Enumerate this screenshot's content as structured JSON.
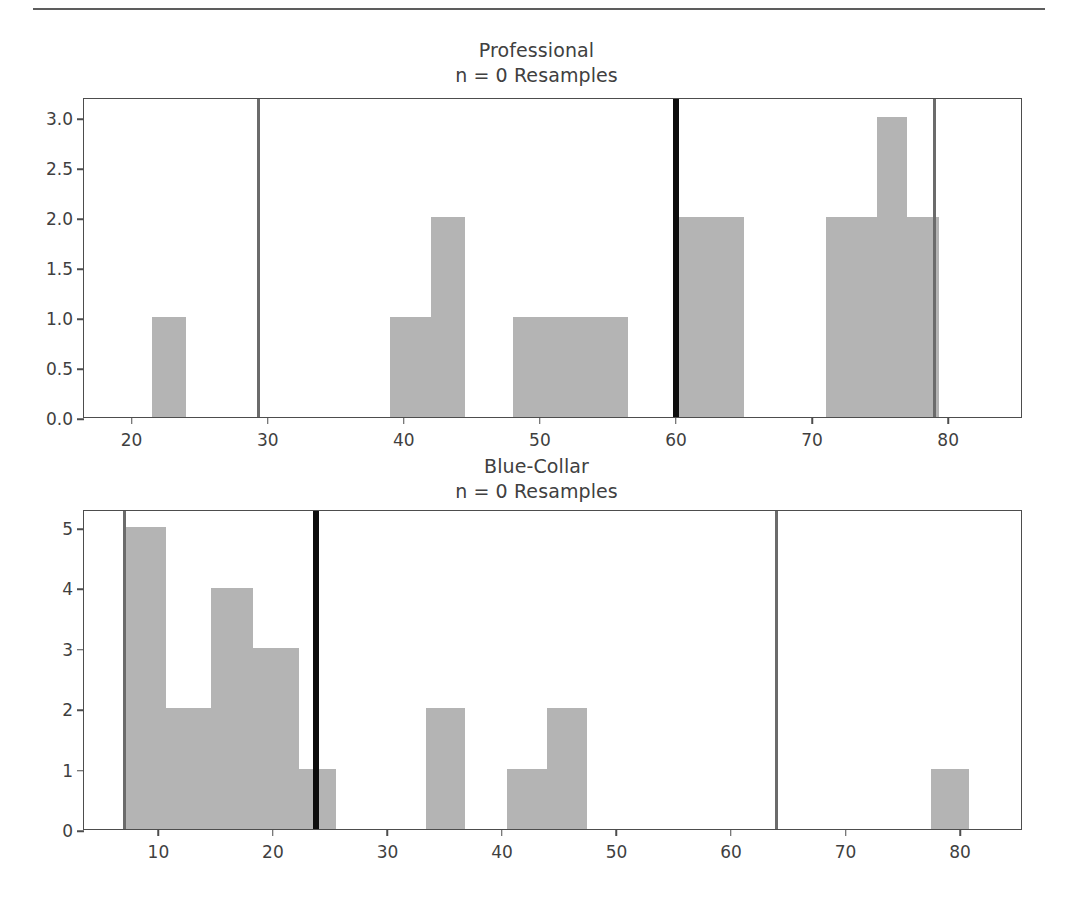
{
  "page": {
    "background": "#ffffff",
    "rule_color": "#5d5d5d"
  },
  "colors": {
    "bar_fill": "#b4b4b4",
    "axis": "#4d4d4d",
    "grey_line": "#6b6b6b",
    "black_line": "#0d0d0d",
    "text": "#3f3f3f"
  },
  "chart_data": [
    {
      "id": "professional",
      "type": "bar",
      "title": "Professional",
      "subtitle": "n = 0 Resamples",
      "xlabel": "",
      "ylabel": "",
      "xlim": [
        16.5,
        85.5
      ],
      "ylim": [
        0.0,
        3.2
      ],
      "grid": false,
      "legend": "none",
      "xticks": [
        20,
        30,
        40,
        50,
        60,
        70,
        80
      ],
      "xtick_labels": [
        "20",
        "30",
        "40",
        "50",
        "60",
        "70",
        "80"
      ],
      "yticks": [
        0.0,
        0.5,
        1.0,
        1.5,
        2.0,
        2.5,
        3.0
      ],
      "ytick_labels": [
        "0.0",
        "0.5",
        "1.0",
        "1.5",
        "2.0",
        "2.5",
        "3.0"
      ],
      "bins": [
        {
          "left": 21.5,
          "right": 24.0,
          "count": 1
        },
        {
          "left": 39.0,
          "right": 42.0,
          "count": 1
        },
        {
          "left": 42.0,
          "right": 44.5,
          "count": 2
        },
        {
          "left": 48.0,
          "right": 56.5,
          "count": 1
        },
        {
          "left": 60.0,
          "right": 65.0,
          "count": 2
        },
        {
          "left": 71.0,
          "right": 74.8,
          "count": 2
        },
        {
          "left": 74.8,
          "right": 77.0,
          "count": 3
        },
        {
          "left": 77.0,
          "right": 79.3,
          "count": 2
        }
      ],
      "vlines": [
        {
          "x": 29.3,
          "color": "#6b6b6b",
          "width": 3,
          "role": "ci-lower"
        },
        {
          "x": 60.0,
          "color": "#0d0d0d",
          "width": 6,
          "role": "observed-statistic"
        },
        {
          "x": 79.0,
          "color": "#6b6b6b",
          "width": 3,
          "role": "ci-upper"
        }
      ]
    },
    {
      "id": "blue-collar",
      "type": "bar",
      "title": "Blue-Collar",
      "subtitle": "n = 0 Resamples",
      "xlabel": "",
      "ylabel": "",
      "xlim": [
        3.5,
        85.5
      ],
      "ylim": [
        0,
        5.3
      ],
      "grid": false,
      "legend": "none",
      "xticks": [
        10,
        20,
        30,
        40,
        50,
        60,
        70,
        80
      ],
      "xtick_labels": [
        "10",
        "20",
        "30",
        "40",
        "50",
        "60",
        "70",
        "80"
      ],
      "yticks": [
        0,
        1,
        2,
        3,
        4,
        5
      ],
      "ytick_labels": [
        "0",
        "1",
        "2",
        "3",
        "4",
        "5"
      ],
      "bins": [
        {
          "left": 7.0,
          "right": 10.7,
          "count": 5
        },
        {
          "left": 10.7,
          "right": 14.6,
          "count": 2
        },
        {
          "left": 14.6,
          "right": 18.3,
          "count": 4
        },
        {
          "left": 18.3,
          "right": 22.3,
          "count": 3
        },
        {
          "left": 22.3,
          "right": 25.5,
          "count": 1
        },
        {
          "left": 33.4,
          "right": 36.8,
          "count": 2
        },
        {
          "left": 40.4,
          "right": 43.9,
          "count": 1
        },
        {
          "left": 43.9,
          "right": 47.4,
          "count": 2
        },
        {
          "left": 77.5,
          "right": 80.8,
          "count": 1
        }
      ],
      "vlines": [
        {
          "x": 7.0,
          "color": "#6b6b6b",
          "width": 3,
          "role": "ci-lower"
        },
        {
          "x": 23.8,
          "color": "#0d0d0d",
          "width": 6,
          "role": "observed-statistic"
        },
        {
          "x": 64.0,
          "color": "#6b6b6b",
          "width": 3,
          "role": "ci-upper"
        }
      ]
    }
  ]
}
